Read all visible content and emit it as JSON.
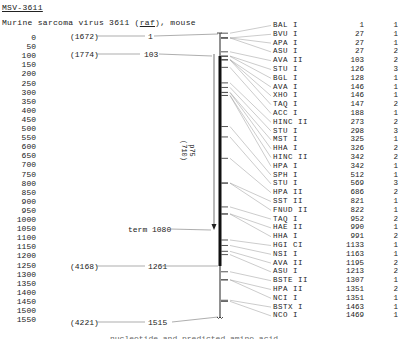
{
  "header": {
    "title": "MSV-3611",
    "subtitle_pre": "Murine sarcoma virus 3611 (",
    "subtitle_gene": "raf",
    "subtitle_post": "), mouse"
  },
  "scale": {
    "ticks": [
      "0",
      "50",
      "100",
      "150",
      "200",
      "250",
      "300",
      "350",
      "400",
      "450",
      "500",
      "550",
      "600",
      "650",
      "700",
      "750",
      "800",
      "850",
      "900",
      "950",
      "1000",
      "1050",
      "1100",
      "1150",
      "1200",
      "1250",
      "1300",
      "1350",
      "1400",
      "1450",
      "1500",
      "1550"
    ]
  },
  "landmarks": [
    {
      "paren": "(1672)",
      "pos": "1"
    },
    {
      "paren": "(1774)",
      "pos": "103"
    },
    {
      "label": "term 1080"
    },
    {
      "paren": "(4168)",
      "pos": "1261"
    },
    {
      "paren": "(4221)",
      "pos": "1515"
    }
  ],
  "protein_label": {
    "name": "p75",
    "size": "(710)"
  },
  "sites": [
    {
      "enzyme": "BAL I",
      "pos": "1",
      "count": "1"
    },
    {
      "enzyme": "BVU I",
      "pos": "27",
      "count": "1"
    },
    {
      "enzyme": "APA I",
      "pos": "27",
      "count": "1"
    },
    {
      "enzyme": "ASU I",
      "pos": "27",
      "count": "2"
    },
    {
      "enzyme": "AVA II",
      "pos": "103",
      "count": "2"
    },
    {
      "enzyme": "STU I",
      "pos": "126",
      "count": "3"
    },
    {
      "enzyme": "BGL I",
      "pos": "128",
      "count": "1"
    },
    {
      "enzyme": "AVA I",
      "pos": "146",
      "count": "1"
    },
    {
      "enzyme": "XHO I",
      "pos": "146",
      "count": "1"
    },
    {
      "enzyme": "TAQ I",
      "pos": "147",
      "count": "2"
    },
    {
      "enzyme": "ACC I",
      "pos": "188",
      "count": "1"
    },
    {
      "enzyme": "HINC II",
      "pos": "273",
      "count": "2"
    },
    {
      "enzyme": "STU I",
      "pos": "298",
      "count": "3"
    },
    {
      "enzyme": "MST I",
      "pos": "325",
      "count": "1"
    },
    {
      "enzyme": "HHA I",
      "pos": "326",
      "count": "2"
    },
    {
      "enzyme": "HINC II",
      "pos": "342",
      "count": "2"
    },
    {
      "enzyme": "HPA I",
      "pos": "342",
      "count": "1"
    },
    {
      "enzyme": "SPH I",
      "pos": "512",
      "count": "1"
    },
    {
      "enzyme": "STU I",
      "pos": "569",
      "count": "3"
    },
    {
      "enzyme": "HPA II",
      "pos": "686",
      "count": "2"
    },
    {
      "enzyme": "SST II",
      "pos": "821",
      "count": "1"
    },
    {
      "enzyme": "FNUD II",
      "pos": "822",
      "count": "1"
    },
    {
      "enzyme": "TAQ I",
      "pos": "952",
      "count": "2"
    },
    {
      "enzyme": "HAE II",
      "pos": "990",
      "count": "1"
    },
    {
      "enzyme": "HHA I",
      "pos": "991",
      "count": "2"
    },
    {
      "enzyme": "HGI CI",
      "pos": "1133",
      "count": "1"
    },
    {
      "enzyme": "NSI I",
      "pos": "1163",
      "count": "1"
    },
    {
      "enzyme": "AVA II",
      "pos": "1195",
      "count": "2"
    },
    {
      "enzyme": "ASU I",
      "pos": "1213",
      "count": "2"
    },
    {
      "enzyme": "BSTE II",
      "pos": "1307",
      "count": "1"
    },
    {
      "enzyme": "HPA II",
      "pos": "1351",
      "count": "2"
    },
    {
      "enzyme": "NCI I",
      "pos": "1351",
      "count": "1"
    },
    {
      "enzyme": "BSTX I",
      "pos": "1463",
      "count": "1"
    },
    {
      "enzyme": "NCO I",
      "pos": "1469",
      "count": "1"
    }
  ],
  "caption": "nucleotide and predicted amino acid"
}
